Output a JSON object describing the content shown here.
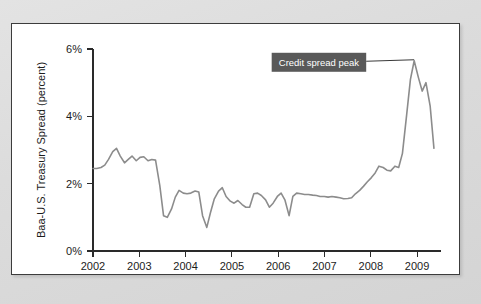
{
  "figure": {
    "background_color": "#d9d9d9",
    "panel_color": "#ffffff",
    "border_color": "#3c3c3c"
  },
  "chart_data": {
    "type": "line",
    "title": "",
    "xlabel": "",
    "ylabel": "Baa-U.S. Treasury Spread (percent)",
    "xlim": [
      2002.0,
      2009.4
    ],
    "ylim": [
      0,
      6
    ],
    "grid": false,
    "legend": null,
    "line_color": "#8c8c8c",
    "x_tick_labels": [
      "2002",
      "2003",
      "2004",
      "2005",
      "2006",
      "2007",
      "2008",
      "2009"
    ],
    "x_ticks": [
      2002,
      2003,
      2004,
      2005,
      2006,
      2007,
      2008,
      2009
    ],
    "y_tick_labels": [
      "0%",
      "2%",
      "4%",
      "6%"
    ],
    "y_ticks": [
      0,
      2,
      4,
      6
    ],
    "series": [
      {
        "name": "Baa-U.S. Treasury Spread",
        "color": "#8c8c8c",
        "x": [
          2002.0,
          2002.08,
          2002.17,
          2002.25,
          2002.33,
          2002.42,
          2002.5,
          2002.58,
          2002.67,
          2002.75,
          2002.83,
          2002.92,
          2003.0,
          2003.08,
          2003.17,
          2003.25,
          2003.33,
          2003.42,
          2003.5,
          2003.58,
          2003.67,
          2003.75,
          2003.83,
          2003.92,
          2004.0,
          2004.08,
          2004.17,
          2004.25,
          2004.33,
          2004.42,
          2004.5,
          2004.58,
          2004.67,
          2004.75,
          2004.83,
          2004.92,
          2005.0,
          2005.08,
          2005.17,
          2005.25,
          2005.33,
          2005.42,
          2005.5,
          2005.58,
          2005.67,
          2005.75,
          2005.83,
          2005.92,
          2006.0,
          2006.08,
          2006.17,
          2006.25,
          2006.33,
          2006.42,
          2006.5,
          2006.58,
          2006.67,
          2006.75,
          2006.83,
          2006.92,
          2007.0,
          2007.08,
          2007.17,
          2007.25,
          2007.33,
          2007.42,
          2007.5,
          2007.58,
          2007.67,
          2007.75,
          2007.83,
          2007.92,
          2008.0,
          2008.08,
          2008.17,
          2008.25,
          2008.33,
          2008.42,
          2008.5,
          2008.58,
          2008.67,
          2008.75,
          2008.83,
          2008.92,
          2009.0,
          2009.08,
          2009.17,
          2009.25
        ],
        "values": [
          2.45,
          2.45,
          2.48,
          2.55,
          2.72,
          2.95,
          3.05,
          2.82,
          2.62,
          2.72,
          2.82,
          2.68,
          2.78,
          2.8,
          2.68,
          2.72,
          2.7,
          1.95,
          1.05,
          1.0,
          1.25,
          1.6,
          1.8,
          1.72,
          1.7,
          1.72,
          1.78,
          1.75,
          1.05,
          0.7,
          1.15,
          1.55,
          1.78,
          1.88,
          1.62,
          1.48,
          1.42,
          1.5,
          1.38,
          1.3,
          1.3,
          1.7,
          1.72,
          1.65,
          1.52,
          1.3,
          1.42,
          1.62,
          1.72,
          1.52,
          1.05,
          1.62,
          1.72,
          1.7,
          1.68,
          1.68,
          1.66,
          1.65,
          1.62,
          1.62,
          1.6,
          1.62,
          1.6,
          1.58,
          1.55,
          1.56,
          1.58,
          1.7,
          1.8,
          1.92,
          2.05,
          2.18,
          2.32,
          2.52,
          2.48,
          2.4,
          2.38,
          2.52,
          2.48,
          2.9,
          4.05,
          5.1,
          5.65,
          5.15,
          4.75,
          5.0,
          4.3,
          3.05
        ]
      }
    ],
    "annotations": [
      {
        "text": "Credit spread peak",
        "target_x": 2008.83,
        "target_y": 5.65,
        "box_fill": "#595959",
        "text_color": "#ffffff"
      }
    ]
  }
}
